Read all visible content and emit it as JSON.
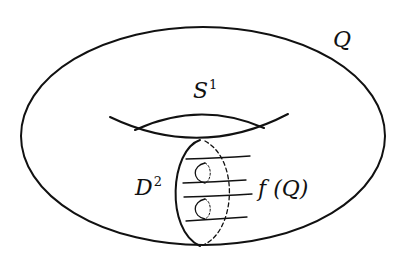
{
  "diagram": {
    "stroke_color": "#111111",
    "background": "#ffffff",
    "labels": {
      "torus": {
        "base": "Q",
        "sup": ""
      },
      "circle": {
        "base": "S",
        "sup": "1"
      },
      "disc": {
        "base": "D",
        "sup": "2"
      },
      "image": {
        "base": "f (Q)",
        "sup": ""
      }
    }
  }
}
